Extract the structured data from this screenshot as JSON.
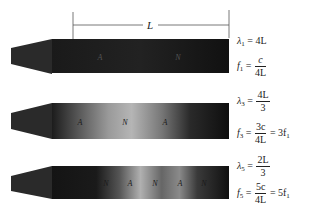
{
  "figure": {
    "dimension_label": "L",
    "pipes": [
      {
        "id": "first",
        "node_labels": [
          "A",
          "N"
        ],
        "gradient": "dark",
        "equations": {
          "wavelength": {
            "symbol": "λ",
            "sub": "1",
            "rhs": "4L"
          },
          "frequency": {
            "symbol": "f",
            "sub": "1",
            "num": "c",
            "den": "4L",
            "extra": ""
          }
        }
      },
      {
        "id": "third",
        "node_labels": [
          "A",
          "N",
          "A"
        ],
        "gradient": "one-light",
        "equations": {
          "wavelength": {
            "symbol": "λ",
            "sub": "3",
            "num": "4L",
            "den": "3"
          },
          "frequency": {
            "symbol": "f",
            "sub": "3",
            "num": "3c",
            "den": "4L",
            "extra": "= 3f",
            "extra_sub": "1"
          }
        }
      },
      {
        "id": "fifth",
        "node_labels": [
          "N",
          "A",
          "N",
          "A",
          "N"
        ],
        "gradient": "two-light",
        "equations": {
          "wavelength": {
            "symbol": "λ",
            "sub": "5",
            "num": "2L",
            "den": "3"
          },
          "frequency": {
            "symbol": "f",
            "sub": "5",
            "num": "5c",
            "den": "4L",
            "extra": "= 5f",
            "extra_sub": "1"
          }
        }
      }
    ],
    "colors": {
      "pipe_dark": "#151515",
      "pipe_light": "#b8b8b8",
      "ink": "#222222"
    }
  }
}
